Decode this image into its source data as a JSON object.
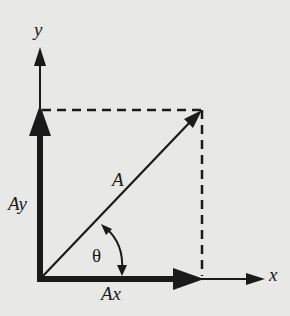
{
  "diagram": {
    "type": "vector-components",
    "labels": {
      "y_axis": "y",
      "x_axis": "x",
      "vector": "A",
      "y_component": "Ay",
      "x_component": "Ax",
      "angle": "θ"
    },
    "colors": {
      "background": "#e8e8e6",
      "ink": "#1a1a1a"
    },
    "geometry": {
      "origin": [
        40,
        279
      ],
      "x_axis_end": [
        264,
        279
      ],
      "y_axis_end": [
        40,
        48
      ],
      "vector_tip": [
        202,
        110
      ],
      "dashed_lines": [
        "horizontal from Ay tip to vector tip",
        "vertical from Ax tip to vector tip"
      ]
    }
  }
}
